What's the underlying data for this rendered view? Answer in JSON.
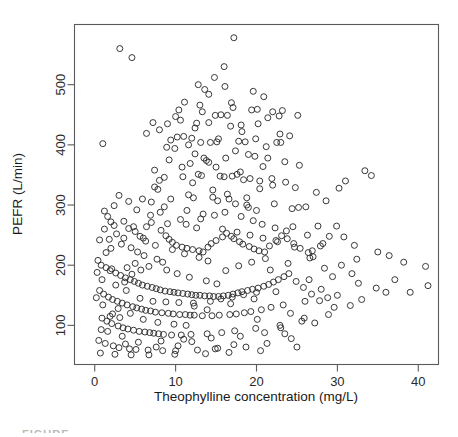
{
  "figure": {
    "caption_fragment": "FIGURE"
  },
  "chart_data": {
    "type": "scatter",
    "title": "",
    "xlabel": "Theophylline concentration (mg/L)",
    "ylabel": "PEFR (L/min)",
    "xlim": [
      -2.5,
      42.5
    ],
    "ylim": [
      35,
      600
    ],
    "xticks": [
      0,
      10,
      20,
      30,
      40
    ],
    "xtick_labels": [
      "0",
      "10",
      "20",
      "30",
      "40"
    ],
    "yticks": [
      100,
      200,
      300,
      400,
      500
    ],
    "ytick_labels": [
      "100",
      "200",
      "300",
      "400",
      "500"
    ],
    "grid": false,
    "legend": null,
    "marker": "open-circle",
    "marker_size": 6,
    "point_color": "#2e2e2e",
    "n_points": 412,
    "points": [
      [
        3.1,
        560
      ],
      [
        17.2,
        578
      ],
      [
        4.6,
        545
      ],
      [
        1.0,
        402
      ],
      [
        14.8,
        512
      ],
      [
        13.6,
        492
      ],
      [
        16.1,
        497
      ],
      [
        19.6,
        489
      ],
      [
        11.1,
        471
      ],
      [
        10.4,
        458
      ],
      [
        10.0,
        447
      ],
      [
        10.6,
        441
      ],
      [
        9.0,
        435
      ],
      [
        14.9,
        449
      ],
      [
        15.6,
        450
      ],
      [
        16.4,
        449
      ],
      [
        22.0,
        455
      ],
      [
        23.2,
        457
      ],
      [
        22.8,
        448
      ],
      [
        21.4,
        445
      ],
      [
        7.2,
        437
      ],
      [
        12.6,
        436
      ],
      [
        14.1,
        437
      ],
      [
        16.8,
        431
      ],
      [
        18.1,
        433
      ],
      [
        19.4,
        458
      ],
      [
        20.1,
        459
      ],
      [
        25.1,
        449
      ],
      [
        10.2,
        413
      ],
      [
        11.0,
        414
      ],
      [
        9.4,
        408
      ],
      [
        12.0,
        411
      ],
      [
        13.1,
        404
      ],
      [
        14.3,
        404
      ],
      [
        15.1,
        405
      ],
      [
        17.8,
        406
      ],
      [
        18.6,
        405
      ],
      [
        21.2,
        397
      ],
      [
        22.5,
        404
      ],
      [
        23.0,
        404
      ],
      [
        24.1,
        415
      ],
      [
        8.9,
        396
      ],
      [
        9.9,
        394
      ],
      [
        12.4,
        385
      ],
      [
        13.5,
        378
      ],
      [
        13.8,
        374
      ],
      [
        14.1,
        371
      ],
      [
        16.2,
        378
      ],
      [
        19.8,
        381
      ],
      [
        20.8,
        364
      ],
      [
        7.4,
        358
      ],
      [
        8.0,
        341
      ],
      [
        8.6,
        346
      ],
      [
        10.9,
        347
      ],
      [
        12.8,
        351
      ],
      [
        13.2,
        349
      ],
      [
        15.5,
        348
      ],
      [
        16.0,
        347
      ],
      [
        17.0,
        348
      ],
      [
        17.6,
        351
      ],
      [
        18.0,
        355
      ],
      [
        18.4,
        342
      ],
      [
        19.2,
        344
      ],
      [
        20.4,
        340
      ],
      [
        21.9,
        344
      ],
      [
        23.6,
        338
      ],
      [
        24.8,
        329
      ],
      [
        7.8,
        326
      ],
      [
        11.6,
        317
      ],
      [
        12.2,
        312
      ],
      [
        14.6,
        313
      ],
      [
        15.2,
        307
      ],
      [
        16.6,
        310
      ],
      [
        17.4,
        302
      ],
      [
        18.8,
        300
      ],
      [
        19.0,
        296
      ],
      [
        20.0,
        291
      ],
      [
        22.2,
        302
      ],
      [
        24.4,
        294
      ],
      [
        26.1,
        297
      ],
      [
        27.4,
        321
      ],
      [
        28.6,
        307
      ],
      [
        30.2,
        328
      ],
      [
        31.0,
        340
      ],
      [
        33.4,
        357
      ],
      [
        34.2,
        349
      ],
      [
        1.2,
        290
      ],
      [
        1.6,
        281
      ],
      [
        2.0,
        272
      ],
      [
        2.4,
        266
      ],
      [
        3.6,
        273
      ],
      [
        4.2,
        261
      ],
      [
        5.0,
        256
      ],
      [
        5.6,
        248
      ],
      [
        6.0,
        245
      ],
      [
        6.4,
        264
      ],
      [
        7.0,
        271
      ],
      [
        8.2,
        258
      ],
      [
        8.8,
        249
      ],
      [
        9.2,
        243
      ],
      [
        9.6,
        238
      ],
      [
        10.1,
        233
      ],
      [
        10.8,
        230
      ],
      [
        11.4,
        228
      ],
      [
        12.1,
        226
      ],
      [
        12.9,
        224
      ],
      [
        13.4,
        222
      ],
      [
        14.0,
        230
      ],
      [
        14.4,
        236
      ],
      [
        15.0,
        241
      ],
      [
        15.8,
        247
      ],
      [
        16.3,
        253
      ],
      [
        16.9,
        248
      ],
      [
        17.2,
        244
      ],
      [
        17.9,
        239
      ],
      [
        18.3,
        235
      ],
      [
        19.1,
        231
      ],
      [
        19.7,
        227
      ],
      [
        20.3,
        224
      ],
      [
        21.0,
        222
      ],
      [
        21.6,
        232
      ],
      [
        22.4,
        241
      ],
      [
        23.1,
        249
      ],
      [
        23.8,
        244
      ],
      [
        24.6,
        236
      ],
      [
        25.4,
        228
      ],
      [
        26.4,
        221
      ],
      [
        27.0,
        214
      ],
      [
        28.2,
        236
      ],
      [
        29.0,
        248
      ],
      [
        30.8,
        247
      ],
      [
        32.1,
        233
      ],
      [
        35.0,
        222
      ],
      [
        36.4,
        216
      ],
      [
        38.2,
        205
      ],
      [
        40.9,
        198
      ],
      [
        41.2,
        166
      ],
      [
        36.0,
        155
      ],
      [
        33.0,
        143
      ],
      [
        31.6,
        133
      ],
      [
        29.6,
        130
      ],
      [
        27.8,
        141
      ],
      [
        26.8,
        152
      ],
      [
        25.8,
        163
      ],
      [
        24.9,
        173
      ],
      [
        0.4,
        208
      ],
      [
        0.8,
        200
      ],
      [
        1.4,
        196
      ],
      [
        1.9,
        191
      ],
      [
        2.6,
        187
      ],
      [
        3.2,
        183
      ],
      [
        3.8,
        179
      ],
      [
        4.4,
        176
      ],
      [
        4.9,
        173
      ],
      [
        5.4,
        170
      ],
      [
        5.9,
        167
      ],
      [
        6.5,
        165
      ],
      [
        7.1,
        163
      ],
      [
        7.6,
        161
      ],
      [
        8.1,
        159
      ],
      [
        8.7,
        157
      ],
      [
        9.3,
        156
      ],
      [
        9.8,
        155
      ],
      [
        10.3,
        154
      ],
      [
        10.9,
        153
      ],
      [
        11.5,
        152
      ],
      [
        12.0,
        151
      ],
      [
        12.5,
        150
      ],
      [
        13.0,
        150
      ],
      [
        13.6,
        149
      ],
      [
        14.2,
        149
      ],
      [
        14.7,
        148
      ],
      [
        15.3,
        148
      ],
      [
        15.9,
        149
      ],
      [
        16.5,
        150
      ],
      [
        17.1,
        152
      ],
      [
        17.7,
        154
      ],
      [
        18.2,
        156
      ],
      [
        18.9,
        158
      ],
      [
        19.5,
        160
      ],
      [
        20.2,
        162
      ],
      [
        20.9,
        165
      ],
      [
        21.5,
        168
      ],
      [
        22.1,
        172
      ],
      [
        22.7,
        176
      ],
      [
        23.4,
        181
      ],
      [
        24.0,
        186
      ],
      [
        0.6,
        158
      ],
      [
        1.1,
        152
      ],
      [
        1.7,
        147
      ],
      [
        2.2,
        143
      ],
      [
        2.8,
        140
      ],
      [
        3.4,
        137
      ],
      [
        4.0,
        134
      ],
      [
        4.7,
        131
      ],
      [
        5.2,
        129
      ],
      [
        5.8,
        127
      ],
      [
        6.3,
        125
      ],
      [
        6.9,
        124
      ],
      [
        7.5,
        122
      ],
      [
        8.3,
        121
      ],
      [
        9.1,
        120
      ],
      [
        9.7,
        119
      ],
      [
        10.5,
        118
      ],
      [
        11.2,
        118
      ],
      [
        11.8,
        117
      ],
      [
        12.3,
        117
      ],
      [
        13.3,
        116
      ],
      [
        14.5,
        116
      ],
      [
        15.4,
        117
      ],
      [
        16.7,
        118
      ],
      [
        17.5,
        119
      ],
      [
        18.5,
        121
      ],
      [
        19.3,
        123
      ],
      [
        20.6,
        126
      ],
      [
        21.8,
        130
      ],
      [
        23.3,
        134
      ],
      [
        0.9,
        112
      ],
      [
        1.5,
        107
      ],
      [
        2.1,
        103
      ],
      [
        2.9,
        99
      ],
      [
        3.5,
        96
      ],
      [
        4.1,
        94
      ],
      [
        4.8,
        92
      ],
      [
        5.5,
        90
      ],
      [
        6.2,
        89
      ],
      [
        6.8,
        88
      ],
      [
        7.3,
        87
      ],
      [
        7.9,
        86
      ],
      [
        8.5,
        85
      ],
      [
        9.5,
        84
      ],
      [
        10.7,
        84
      ],
      [
        11.9,
        85
      ],
      [
        13.9,
        86
      ],
      [
        15.7,
        88
      ],
      [
        17.3,
        91
      ],
      [
        19.9,
        95
      ],
      [
        22.9,
        100
      ],
      [
        25.6,
        107
      ],
      [
        28.9,
        118
      ],
      [
        0.5,
        75
      ],
      [
        1.3,
        70
      ],
      [
        2.3,
        66
      ],
      [
        3.0,
        63
      ],
      [
        4.3,
        61
      ],
      [
        5.1,
        60
      ],
      [
        6.6,
        59
      ],
      [
        8.4,
        58
      ],
      [
        10.0,
        58
      ],
      [
        12.7,
        59
      ],
      [
        14.9,
        61
      ],
      [
        18.7,
        64
      ],
      [
        21.3,
        70
      ],
      [
        24.3,
        78
      ],
      [
        0.7,
        54
      ],
      [
        2.5,
        52
      ],
      [
        4.5,
        51
      ],
      [
        6.7,
        51
      ],
      [
        9.9,
        52
      ],
      [
        13.7,
        53
      ],
      [
        16.6,
        55
      ],
      [
        20.5,
        58
      ],
      [
        25.0,
        64
      ],
      [
        1.8,
        243
      ],
      [
        2.7,
        252
      ],
      [
        3.3,
        235
      ],
      [
        4.5,
        229
      ],
      [
        5.3,
        222
      ],
      [
        6.1,
        216
      ],
      [
        7.7,
        210
      ],
      [
        8.4,
        205
      ],
      [
        9.0,
        269
      ],
      [
        10.6,
        276
      ],
      [
        11.3,
        268
      ],
      [
        12.6,
        262
      ],
      [
        13.1,
        277
      ],
      [
        14.8,
        283
      ],
      [
        16.1,
        288
      ],
      [
        18.1,
        281
      ],
      [
        19.6,
        274
      ],
      [
        20.7,
        268
      ],
      [
        22.3,
        262
      ],
      [
        23.7,
        257
      ],
      [
        3.9,
        158
      ],
      [
        4.6,
        185
      ],
      [
        5.7,
        192
      ],
      [
        6.7,
        198
      ],
      [
        8.9,
        192
      ],
      [
        10.2,
        186
      ],
      [
        11.7,
        180
      ],
      [
        13.8,
        174
      ],
      [
        15.1,
        169
      ],
      [
        16.2,
        191
      ],
      [
        17.8,
        199
      ],
      [
        19.4,
        205
      ],
      [
        21.1,
        211
      ],
      [
        1.0,
        134
      ],
      [
        2.6,
        167
      ],
      [
        3.7,
        172
      ],
      [
        5.6,
        145
      ],
      [
        7.2,
        140
      ],
      [
        8.8,
        139
      ],
      [
        10.4,
        138
      ],
      [
        12.2,
        137
      ],
      [
        14.3,
        140
      ],
      [
        15.6,
        144
      ],
      [
        17.0,
        147
      ],
      [
        18.4,
        151
      ],
      [
        20.0,
        155
      ],
      [
        21.7,
        192
      ],
      [
        23.9,
        203
      ],
      [
        26.6,
        212
      ],
      [
        0.3,
        188
      ],
      [
        0.9,
        176
      ],
      [
        1.4,
        221
      ],
      [
        2.0,
        228
      ],
      [
        3.6,
        245
      ],
      [
        4.0,
        196
      ],
      [
        5.0,
        203
      ],
      [
        6.3,
        240
      ],
      [
        7.5,
        233
      ],
      [
        9.6,
        226
      ],
      [
        11.1,
        219
      ],
      [
        12.9,
        213
      ],
      [
        14.0,
        207
      ],
      [
        15.8,
        260
      ],
      [
        17.6,
        255
      ],
      [
        19.2,
        250
      ],
      [
        20.8,
        245
      ],
      [
        22.6,
        239
      ],
      [
        24.7,
        230
      ],
      [
        26.9,
        224
      ],
      [
        7.0,
        305
      ],
      [
        8.6,
        297
      ],
      [
        11.4,
        291
      ],
      [
        13.4,
        285
      ],
      [
        14.6,
        325
      ],
      [
        16.4,
        318
      ],
      [
        18.8,
        312
      ],
      [
        20.4,
        327
      ],
      [
        22.0,
        333
      ],
      [
        9.2,
        375
      ],
      [
        11.8,
        369
      ],
      [
        15.0,
        363
      ],
      [
        17.4,
        390
      ],
      [
        19.0,
        384
      ],
      [
        21.4,
        378
      ],
      [
        23.5,
        372
      ],
      [
        25.3,
        366
      ],
      [
        6.4,
        419
      ],
      [
        8.0,
        425
      ],
      [
        12.4,
        428
      ],
      [
        13.0,
        466
      ],
      [
        16.9,
        470
      ],
      [
        20.9,
        480
      ],
      [
        4.8,
        264
      ],
      [
        5.9,
        310
      ],
      [
        7.4,
        330
      ],
      [
        2.2,
        119
      ],
      [
        3.1,
        113
      ],
      [
        1.6,
        90
      ],
      [
        0.2,
        146
      ],
      [
        0.6,
        242
      ],
      [
        1.2,
        260
      ],
      [
        2.4,
        299
      ],
      [
        26.3,
        250
      ],
      [
        27.6,
        265
      ],
      [
        28.4,
        195
      ],
      [
        29.4,
        181
      ],
      [
        30.5,
        200
      ],
      [
        31.8,
        186
      ],
      [
        32.6,
        170
      ],
      [
        34.8,
        162
      ],
      [
        37.1,
        176
      ],
      [
        39.0,
        155
      ],
      [
        24.2,
        120
      ],
      [
        25.9,
        112
      ],
      [
        27.2,
        104
      ],
      [
        23.0,
        96
      ],
      [
        21.0,
        88
      ],
      [
        18.0,
        82
      ],
      [
        14.4,
        79
      ],
      [
        11.0,
        77
      ],
      [
        8.2,
        74
      ],
      [
        5.4,
        72
      ],
      [
        3.8,
        69
      ],
      [
        26.0,
        140
      ],
      [
        28.0,
        160
      ],
      [
        30.0,
        150
      ],
      [
        32.4,
        210
      ],
      [
        25.2,
        296
      ],
      [
        24.5,
        264
      ],
      [
        27.9,
        232
      ],
      [
        29.9,
        265
      ],
      [
        13.3,
        455
      ],
      [
        15.3,
        410
      ],
      [
        18.2,
        422
      ],
      [
        12.1,
        337
      ],
      [
        10.8,
        363
      ],
      [
        9.4,
        310
      ],
      [
        8.1,
        288
      ],
      [
        6.9,
        283
      ],
      [
        5.2,
        292
      ],
      [
        4.2,
        306
      ],
      [
        3.0,
        316
      ],
      [
        2.1,
        194
      ],
      [
        11.6,
        400
      ],
      [
        20.2,
        435
      ],
      [
        22.9,
        418
      ],
      [
        19.9,
        410
      ],
      [
        17.1,
        462
      ],
      [
        14.1,
        484
      ],
      [
        12.8,
        500
      ],
      [
        16.0,
        530
      ],
      [
        11.3,
        100
      ],
      [
        12.3,
        132
      ],
      [
        13.9,
        126
      ],
      [
        16.8,
        136
      ],
      [
        19.7,
        144
      ],
      [
        22.4,
        156
      ],
      [
        6.0,
        110
      ],
      [
        7.8,
        105
      ],
      [
        9.8,
        102
      ],
      [
        4.4,
        120
      ],
      [
        2.9,
        128
      ],
      [
        1.9,
        115
      ],
      [
        0.8,
        93
      ],
      [
        3.4,
        82
      ],
      [
        10.3,
        66
      ],
      [
        17.2,
        68
      ],
      [
        12.0,
        73
      ],
      [
        15.2,
        62
      ],
      [
        7.6,
        64
      ],
      [
        23.5,
        86
      ],
      [
        20.1,
        110
      ],
      [
        26.5,
        176
      ],
      [
        28.8,
        146
      ]
    ]
  }
}
